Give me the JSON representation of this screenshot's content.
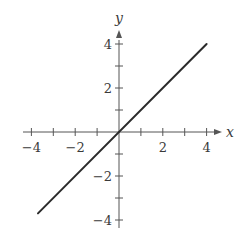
{
  "chart_data": {
    "type": "line",
    "title": "",
    "xlabel": "x",
    "ylabel": "y",
    "xlim": [
      -4,
      4
    ],
    "ylim": [
      -4,
      4
    ],
    "grid": false,
    "legend": null,
    "x_ticks": [
      -4,
      -3,
      -2,
      -1,
      1,
      2,
      3,
      4
    ],
    "y_ticks": [
      -4,
      -3,
      -2,
      -1,
      1,
      2,
      3,
      4
    ],
    "x_tick_labels": [
      {
        "value": -4,
        "label": "−4"
      },
      {
        "value": -2,
        "label": "−2"
      },
      {
        "value": 2,
        "label": "2"
      },
      {
        "value": 4,
        "label": "4"
      }
    ],
    "y_tick_labels": [
      {
        "value": 4,
        "label": "4"
      },
      {
        "value": 2,
        "label": "2"
      },
      {
        "value": -2,
        "label": "−2"
      },
      {
        "value": -4,
        "label": "−4"
      }
    ],
    "series": [
      {
        "name": "y = x",
        "x": [
          -3.7,
          4
        ],
        "y": [
          -3.7,
          4
        ],
        "color": "#2b2b2b"
      }
    ]
  },
  "colors": {
    "axis": "#555555",
    "line": "#2b2b2b",
    "text": "#3a3a3a"
  }
}
